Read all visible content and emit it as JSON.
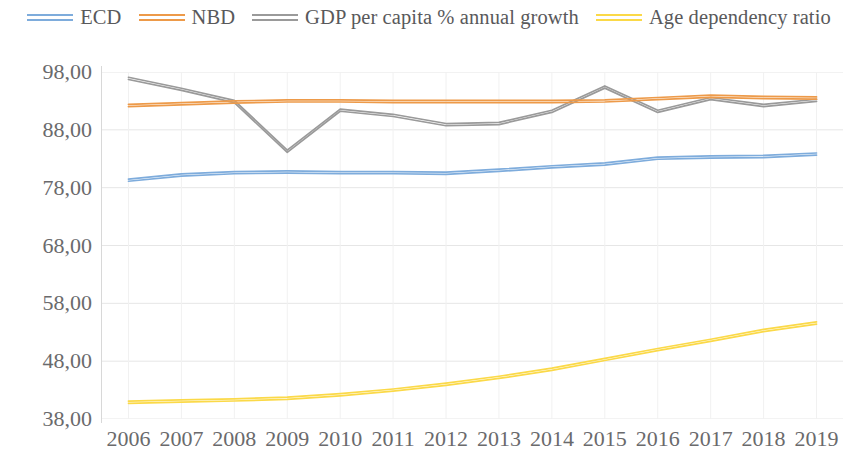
{
  "chart_data": {
    "type": "line",
    "title": "",
    "subtitle": "",
    "xlabel": "",
    "ylabel": "",
    "grid": true,
    "legend_position": "top",
    "x": [
      "2006",
      "2007",
      "2008",
      "2009",
      "2010",
      "2011",
      "2012",
      "2013",
      "2014",
      "2015",
      "2016",
      "2017",
      "2018",
      "2019"
    ],
    "categories": [
      "2006",
      "2007",
      "2008",
      "2009",
      "2010",
      "2011",
      "2012",
      "2013",
      "2014",
      "2015",
      "2016",
      "2017",
      "2018",
      "2019"
    ],
    "ylim": [
      38.0,
      98.0
    ],
    "yticks": [
      38.0,
      48.0,
      58.0,
      68.0,
      78.0,
      88.0,
      98.0
    ],
    "ytick_labels": [
      "38,00",
      "48,00",
      "58,00",
      "68,00",
      "78,00",
      "88,00",
      "98,00"
    ],
    "xtick_labels": [
      "2006",
      "2007",
      "2008",
      "2009",
      "2010",
      "2011",
      "2012",
      "2013",
      "2014",
      "2015",
      "2016",
      "2017",
      "2018",
      "2019"
    ],
    "series": [
      {
        "name": "ECD",
        "color": "#7EACDC",
        "values": [
          79.3,
          80.2,
          80.6,
          80.7,
          80.6,
          80.6,
          80.5,
          81.0,
          81.6,
          82.1,
          83.1,
          83.3,
          83.4,
          83.8
        ]
      },
      {
        "name": "NBD",
        "color": "#ED9A49",
        "values": [
          92.2,
          92.5,
          92.8,
          93.0,
          93.0,
          92.9,
          92.9,
          92.9,
          92.9,
          93.0,
          93.4,
          93.8,
          93.6,
          93.5
        ]
      },
      {
        "name": "GDP per capita % annual growth",
        "color": "#9A9A9A",
        "values": [
          96.9,
          95.0,
          92.9,
          84.3,
          91.4,
          90.5,
          88.9,
          89.1,
          91.2,
          95.4,
          91.2,
          93.4,
          92.2,
          93.1
        ]
      },
      {
        "name": "Age dependency ratio",
        "color": "#FBD948",
        "values": [
          40.9,
          41.1,
          41.3,
          41.6,
          42.2,
          43.0,
          44.0,
          45.2,
          46.6,
          48.3,
          50.0,
          51.6,
          53.3,
          54.6
        ]
      }
    ]
  },
  "legend": {
    "items": [
      {
        "label": "ECD",
        "color": "#7EACDC",
        "swatch_name": "legend-swatch-ecd"
      },
      {
        "label": "NBD",
        "color": "#ED9A49",
        "swatch_name": "legend-swatch-nbd"
      },
      {
        "label": "GDP per capita % annual growth",
        "color": "#9A9A9A",
        "swatch_name": "legend-swatch-gdp"
      },
      {
        "label": "Age dependency ratio",
        "color": "#FBD948",
        "swatch_name": "legend-swatch-age"
      }
    ]
  },
  "axes": {
    "y": {
      "labels": [
        "98,00",
        "88,00",
        "78,00",
        "68,00",
        "58,00",
        "48,00",
        "38,00"
      ],
      "values": [
        98.0,
        88.0,
        78.0,
        68.0,
        58.0,
        48.0,
        38.0
      ]
    },
    "x": {
      "labels": [
        "2006",
        "2007",
        "2008",
        "2009",
        "2010",
        "2011",
        "2012",
        "2013",
        "2014",
        "2015",
        "2016",
        "2017",
        "2018",
        "2019"
      ]
    }
  },
  "colors": {
    "grid": "#E6E6E6",
    "axis_text": "#6a6a6c",
    "legend_text": "#59595b",
    "background": "#ffffff"
  }
}
